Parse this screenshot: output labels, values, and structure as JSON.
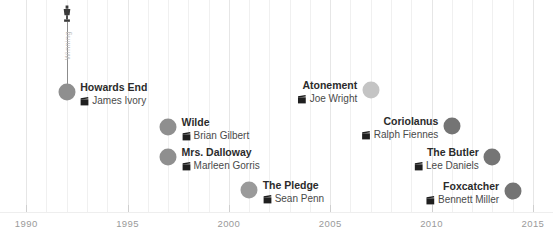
{
  "chart_data": {
    "type": "scatter",
    "title": "",
    "xlabel": "",
    "ylabel": "",
    "xlim": [
      1989.2,
      2015.4
    ],
    "grid": true,
    "legend": "none",
    "axis_ticks": [
      "1990",
      "1995",
      "2000",
      "2005",
      "2010",
      "2015"
    ],
    "axis_tick_values": [
      1990,
      1995,
      2000,
      2005,
      2010,
      2015
    ],
    "annotation": {
      "label": "Winning",
      "icon": "trophy-icon",
      "year": 1992
    },
    "points": [
      {
        "title": "Howards End",
        "director": "James Ivory",
        "year": 1992,
        "y_px": 92,
        "radius": 8.5,
        "color": "#8f8f8f",
        "label_side": "left",
        "annotated": true
      },
      {
        "title": "Wilde",
        "director": "Brian Gilbert",
        "year": 1997,
        "y_px": 127,
        "radius": 8.5,
        "color": "#8f8f8f",
        "label_side": "left",
        "annotated": false
      },
      {
        "title": "Mrs. Dalloway",
        "director": "Marleen Gorris",
        "year": 1997,
        "y_px": 157,
        "radius": 8.5,
        "color": "#8f8f8f",
        "label_side": "left",
        "annotated": false
      },
      {
        "title": "The Pledge",
        "director": "Sean Penn",
        "year": 2001,
        "y_px": 190,
        "radius": 8.5,
        "color": "#9a9a9a",
        "label_side": "left",
        "annotated": false
      },
      {
        "title": "Atonement",
        "director": "Joe Wright",
        "year": 2007,
        "y_px": 90,
        "radius": 8.5,
        "color": "#c4c4c4",
        "label_side": "right",
        "annotated": false
      },
      {
        "title": "Coriolanus",
        "director": "Ralph Fiennes",
        "year": 2011,
        "y_px": 126,
        "radius": 8.5,
        "color": "#747474",
        "label_side": "right",
        "annotated": false
      },
      {
        "title": "The Butler",
        "director": "Lee Daniels",
        "year": 2013,
        "y_px": 157,
        "radius": 8.5,
        "color": "#757575",
        "label_side": "right",
        "annotated": false
      },
      {
        "title": "Foxcatcher",
        "director": "Bennett Miller",
        "year": 2014,
        "y_px": 191,
        "radius": 8.5,
        "color": "#747474",
        "label_side": "right",
        "annotated": false
      }
    ]
  },
  "colors": {
    "background": "#ffffff",
    "gridline": "#f0f0f0",
    "gridline_major": "#e6e6e6",
    "tick": "#cfcfcf",
    "tick_label": "#9a9a9a",
    "title_text": "#2b2b2b",
    "director_text": "#4a4a4a",
    "stem": "#8c8c8c",
    "stem_label": "#bdbdbd"
  },
  "icons": {
    "director": "clapperboard-icon",
    "award": "trophy-icon"
  }
}
